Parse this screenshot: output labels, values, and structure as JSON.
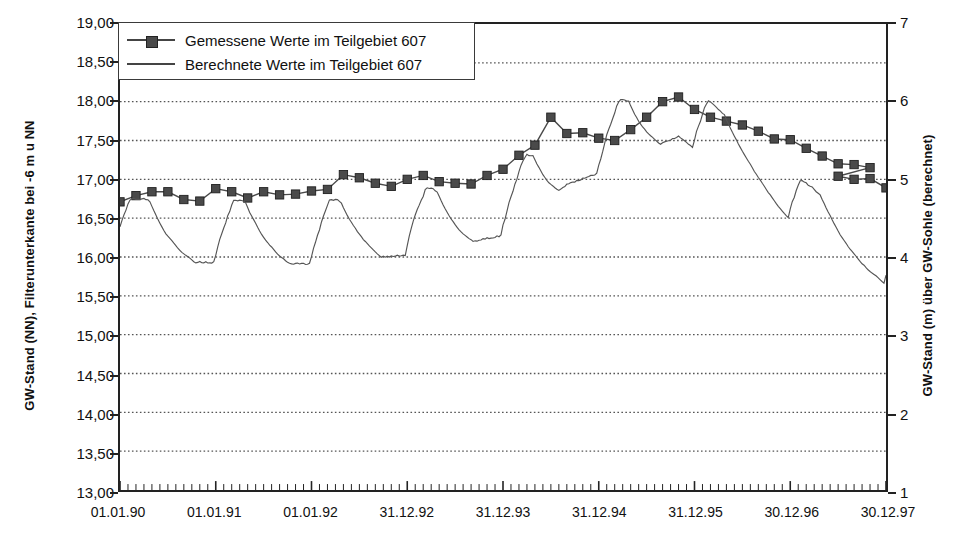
{
  "chart_data": {
    "type": "line",
    "title": "",
    "ylabel": "GW-Stand (NN), Filterunterkante bei -6 m u NN",
    "ylabel_right": "GW-Stand (m) über GW-Sohle (berechnet)",
    "xlabel": "",
    "ylim": [
      13.0,
      19.0
    ],
    "ylim_right": [
      1,
      7
    ],
    "ytick_labels": [
      "19,00",
      "18,50",
      "18,00",
      "17,50",
      "17,00",
      "16,50",
      "16,00",
      "15,50",
      "15,00",
      "14,50",
      "14,00",
      "13,50",
      "13,00"
    ],
    "ytick_values": [
      19.0,
      18.5,
      18.0,
      17.5,
      17.0,
      16.5,
      16.0,
      15.5,
      15.0,
      14.5,
      14.0,
      13.5,
      13.0
    ],
    "ytick_right_labels": [
      "7",
      "6",
      "5",
      "4",
      "3",
      "2",
      "1"
    ],
    "ytick_right_values": [
      7,
      6,
      5,
      4,
      3,
      2,
      1
    ],
    "xtick_labels": [
      "01.01.90",
      "01.01.91",
      "01.01.92",
      "31.12.92",
      "31.12.93",
      "31.12.94",
      "31.12.95",
      "30.12.96",
      "30.12.97"
    ],
    "xlim": [
      0,
      96
    ],
    "grid": "horizontal-dotted",
    "legend_position": "top-left",
    "colors": {
      "measured": "#4a4a4a",
      "computed": "#555555",
      "grid": "#555555",
      "axis": "#222222"
    },
    "series": [
      {
        "name": "Gemessene Werte im Teilgebiet 607",
        "style": "line-with-square-markers",
        "x": [
          0,
          2,
          4,
          6,
          8,
          10,
          12,
          14,
          16,
          18,
          20,
          22,
          24,
          26,
          28,
          30,
          32,
          34,
          36,
          38,
          40,
          42,
          44,
          46,
          48,
          50,
          52,
          54,
          56,
          58,
          60,
          62,
          64,
          66,
          68,
          70,
          72,
          74,
          76,
          78,
          80,
          82,
          84,
          86,
          88,
          90,
          92,
          94
        ],
        "values": [
          16.71,
          16.79,
          16.84,
          16.84,
          16.74,
          16.72,
          16.88,
          16.84,
          16.76,
          16.84,
          16.8,
          16.81,
          16.85,
          16.87,
          17.06,
          17.02,
          16.95,
          16.91,
          17.0,
          17.05,
          16.97,
          16.95,
          16.94,
          17.05,
          17.13,
          17.31,
          17.44,
          17.8,
          17.59,
          17.6,
          17.53,
          17.5,
          17.64,
          17.8,
          18.0,
          18.06,
          17.9,
          17.8,
          17.75,
          17.7,
          17.62,
          17.52,
          17.51,
          17.4,
          17.3,
          17.2,
          17.19,
          17.15
        ],
        "values_tail_x": [
          88,
          90,
          92,
          94,
          96
        ],
        "values_tail": [
          17.12,
          17.04,
          17.0,
          17.01,
          16.89
        ]
      },
      {
        "name": "Berechnete Werte im Teilgebiet 607",
        "style": "thin-line",
        "description": "Sawtooth recession curve oscillating between about 16.00 and 18.05"
      }
    ]
  },
  "legend": {
    "items": [
      {
        "label": "Gemessene Werte im Teilgebiet 607",
        "key": "square-marker-line"
      },
      {
        "label": "Berechnete Werte im Teilgebiet 607",
        "key": "plain-line"
      }
    ]
  }
}
